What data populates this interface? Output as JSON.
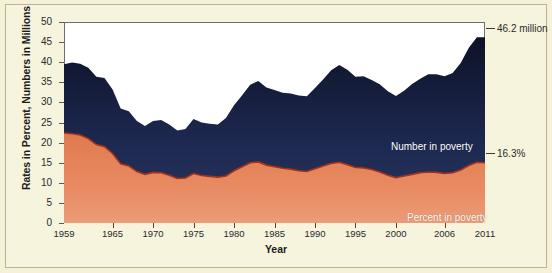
{
  "chart_data": {
    "type": "area",
    "title": "",
    "xlabel": "Year",
    "ylabel": "Rates in Percent, Numbers in Millions",
    "xlim": [
      1959,
      2011
    ],
    "ylim": [
      0,
      50
    ],
    "yticks": [
      0,
      5,
      10,
      15,
      20,
      25,
      30,
      35,
      40,
      45,
      50
    ],
    "xticks": [
      1959,
      1965,
      1970,
      1975,
      1980,
      1985,
      1990,
      1995,
      2000,
      2006,
      2011
    ],
    "grid": false,
    "legend_position": "inside",
    "annotations": [
      {
        "text": "46.2 million",
        "series": "Number in poverty",
        "x": 2011,
        "y": 46.2
      },
      {
        "text": "16.3%",
        "series": "Percent in poverty",
        "x": 2011,
        "y": 16.3
      }
    ],
    "x": [
      1959,
      1960,
      1961,
      1962,
      1963,
      1964,
      1965,
      1966,
      1967,
      1968,
      1969,
      1970,
      1971,
      1972,
      1973,
      1974,
      1975,
      1976,
      1977,
      1978,
      1979,
      1980,
      1981,
      1982,
      1983,
      1984,
      1985,
      1986,
      1987,
      1988,
      1989,
      1990,
      1991,
      1992,
      1993,
      1994,
      1995,
      1996,
      1997,
      1998,
      1999,
      2000,
      2001,
      2002,
      2003,
      2004,
      2005,
      2006,
      2007,
      2008,
      2009,
      2010,
      2011
    ],
    "series": [
      {
        "name": "Number in poverty",
        "units": "millions",
        "color": "#1b2547",
        "values": [
          39.5,
          39.9,
          39.6,
          38.6,
          36.4,
          36.1,
          33.2,
          28.5,
          27.8,
          25.4,
          24.1,
          25.4,
          25.6,
          24.5,
          23.0,
          23.4,
          25.9,
          25.0,
          24.7,
          24.5,
          26.1,
          29.3,
          31.8,
          34.4,
          35.3,
          33.7,
          33.1,
          32.4,
          32.2,
          31.7,
          31.5,
          33.6,
          35.7,
          38.0,
          39.3,
          38.1,
          36.4,
          36.5,
          35.6,
          34.5,
          32.8,
          31.6,
          32.9,
          34.6,
          35.9,
          37.0,
          37.0,
          36.5,
          37.3,
          39.8,
          43.6,
          46.2,
          46.2
        ]
      },
      {
        "name": "Percent in poverty",
        "units": "percent",
        "color": "#e8835a",
        "values": [
          22.4,
          22.2,
          21.9,
          21.0,
          19.5,
          19.0,
          17.3,
          14.7,
          14.2,
          12.8,
          12.1,
          12.6,
          12.5,
          11.9,
          11.1,
          11.2,
          12.3,
          11.8,
          11.6,
          11.4,
          11.7,
          13.0,
          14.0,
          15.0,
          15.2,
          14.4,
          14.0,
          13.6,
          13.4,
          13.0,
          12.8,
          13.5,
          14.2,
          14.8,
          15.1,
          14.5,
          13.8,
          13.7,
          13.3,
          12.7,
          11.9,
          11.3,
          11.7,
          12.1,
          12.5,
          12.7,
          12.6,
          12.3,
          12.5,
          13.2,
          14.3,
          15.1,
          15.0
        ]
      }
    ]
  },
  "figure": {
    "y_axis_title": "Rates in Percent, Numbers in Millions",
    "x_axis_title": "Year",
    "series_labels": {
      "number": "Number in poverty",
      "percent": "Percent in poverty"
    },
    "callouts": {
      "number": "46.2 million",
      "percent": "16.3%"
    },
    "y_tick_labels": [
      "50",
      "45",
      "40",
      "35",
      "30",
      "25",
      "20",
      "15",
      "10",
      "5",
      "0"
    ],
    "x_tick_labels": [
      "1959",
      "1965",
      "1970",
      "1975",
      "1980",
      "1985",
      "1990",
      "1995",
      "2000",
      "2006",
      "2011"
    ],
    "colors": {
      "background": "#f7f3dc",
      "plot_background": "#ffffff",
      "number_series": "#1b2547",
      "percent_series": "#e8835a",
      "percent_line": "#a8321a",
      "border": "#6e6e6e"
    }
  }
}
